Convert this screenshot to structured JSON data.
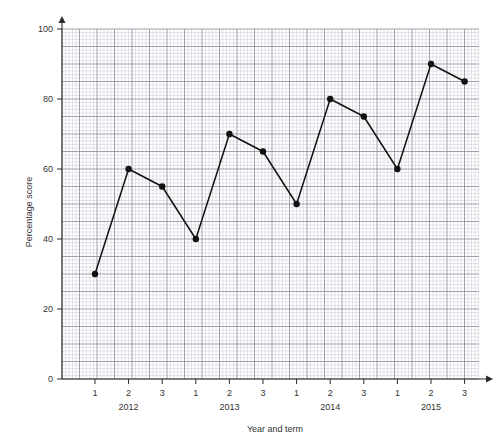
{
  "chart_data": {
    "type": "line",
    "title": "",
    "xlabel": "Year and term",
    "ylabel": "Percentage score",
    "ylim": [
      0,
      100
    ],
    "ytick_values": [
      0,
      20,
      40,
      60,
      80,
      100
    ],
    "ytick_labels": [
      "0",
      "20",
      "40",
      "60",
      "80",
      "100"
    ],
    "grid": true,
    "grid_minor_step": 1,
    "grid_major_step": 5,
    "legend": "none",
    "categories": [
      "2012 1",
      "2012 2",
      "2012 3",
      "2013 1",
      "2013 2",
      "2013 3",
      "2014 1",
      "2014 2",
      "2014 3",
      "2015 1",
      "2015 2",
      "2015 3"
    ],
    "xtick_labels": [
      "1",
      "2",
      "3",
      "1",
      "2",
      "3",
      "1",
      "2",
      "3",
      "1",
      "2",
      "3"
    ],
    "group_labels": [
      "2012",
      "2013",
      "2014",
      "2015"
    ],
    "values": [
      30,
      60,
      55,
      40,
      70,
      65,
      50,
      80,
      75,
      60,
      90,
      85
    ],
    "series": [
      {
        "name": "Percentage score",
        "values": [
          30,
          60,
          55,
          40,
          70,
          65,
          50,
          80,
          75,
          60,
          90,
          85
        ]
      }
    ],
    "colors": {
      "line": "#111111",
      "marker": "#111111",
      "grid_minor": "#c9c9d4",
      "grid_major": "#8b8b99",
      "axis": "#2b2b2b",
      "background": "#ffffff"
    }
  },
  "geometry": {
    "plot_left": 62,
    "plot_right": 479,
    "plot_top": 29,
    "plot_bottom": 379,
    "x_first_tick": 95,
    "x_tick_step": 33.6,
    "minor_px": 3.5,
    "major_px": 17.5
  }
}
